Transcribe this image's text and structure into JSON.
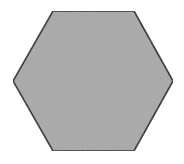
{
  "shape": {
    "type": "hexagon",
    "vertices": [
      [
        53,
        11
      ],
      [
        134,
        11
      ],
      [
        173,
        81
      ],
      [
        134,
        151
      ],
      [
        53,
        151
      ],
      [
        13,
        81
      ]
    ],
    "fill": "#a9a9a9",
    "stroke": "#222222",
    "stroke_width": 1.6
  },
  "background": "#ffffff"
}
